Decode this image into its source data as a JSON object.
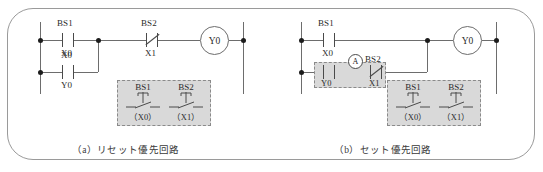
{
  "figure": {
    "colors": {
      "line": "#6d6d6d",
      "contact": "#4a4a4a",
      "text": "#2b2b2b",
      "highlight_fill": "#d9d9d9",
      "highlight_border": "#8a8a8a",
      "frame": "#9a9a9a",
      "background": "#ffffff"
    }
  },
  "panel_a": {
    "caption": "（a）リセット優先回路",
    "rung1": {
      "contact1": {
        "name": "BS1",
        "code": "X0",
        "type": "normally-open"
      },
      "contact2": {
        "name": "BS2",
        "code": "X1",
        "type": "normally-closed"
      },
      "coil": {
        "label": "Y0"
      }
    },
    "rung2": {
      "contact1": {
        "name": "X0",
        "code": "Y0",
        "type": "normally-open"
      }
    },
    "legend": {
      "buttons": [
        {
          "name": "BS1",
          "code": "（X0）"
        },
        {
          "name": "BS2",
          "code": "（X1）"
        }
      ]
    }
  },
  "panel_b": {
    "caption": "（b）セット優先回路",
    "rung1": {
      "contact1": {
        "name": "BS1",
        "code": "X0",
        "type": "normally-open"
      },
      "coil": {
        "label": "Y0"
      }
    },
    "rung2": {
      "contact1": {
        "name": "X0",
        "code": "Y0",
        "type": "normally-open"
      },
      "contact2": {
        "name": "BS2",
        "code": "X1",
        "type": "normally-closed"
      },
      "marker": {
        "label": "A"
      }
    },
    "legend": {
      "buttons": [
        {
          "name": "BS1",
          "code": "（X0）"
        },
        {
          "name": "BS2",
          "code": "（X1）"
        }
      ]
    }
  }
}
